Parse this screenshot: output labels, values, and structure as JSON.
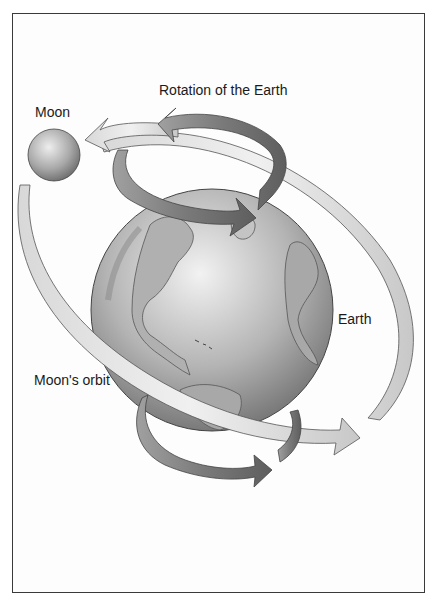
{
  "diagram": {
    "type": "illustration",
    "labels": {
      "rotation": "Rotation of the Earth",
      "moon": "Moon",
      "earth": "Earth",
      "orbit": "Moon's orbit"
    },
    "nodes": [
      {
        "id": "moon",
        "label": "Moon",
        "shape": "sphere"
      },
      {
        "id": "earth",
        "label": "Earth",
        "shape": "globe"
      }
    ],
    "arrows": [
      {
        "id": "rotation-arrow",
        "label": "Rotation of the Earth",
        "direction": "counter-clockwise (top view)"
      },
      {
        "id": "orbit-arrow",
        "label": "Moon's orbit",
        "direction": "around Earth"
      }
    ],
    "colors": {
      "border": "#3a3a3a",
      "band_light": "#e6e6e6",
      "band_dark": "#8c8c8c",
      "globe_light": "#e8e8e8",
      "globe_dark": "#7a7a7a"
    }
  }
}
